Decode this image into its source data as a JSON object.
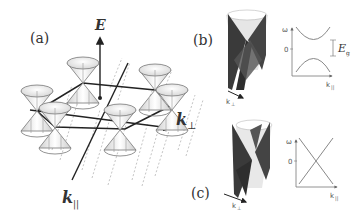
{
  "figure": {
    "panels": {
      "a": {
        "label": "(a)",
        "axis_energy": "E",
        "axis_k_perp": "k",
        "axis_k_perp_sub": "⊥",
        "axis_k_par": "k",
        "axis_k_par_sub": "||",
        "description": "Hexagonal lattice of Dirac cones in momentum space"
      },
      "b": {
        "label": "(b)",
        "cone_axis": "k",
        "cone_axis_sub": "⊥",
        "plot": {
          "y_label": "ω",
          "y_tick": "0",
          "x_label": "k",
          "x_label_sub": "||",
          "gap_label": "E",
          "gap_label_sub": "g",
          "description": "Gapped dispersion"
        }
      },
      "c": {
        "label": "(c)",
        "cone_axis": "k",
        "cone_axis_sub": "⊥",
        "plot": {
          "y_label": "ω",
          "y_tick": "0",
          "x_label": "k",
          "x_label_sub": "||",
          "description": "Linear crossing (gapless) dispersion"
        }
      }
    },
    "colors": {
      "line": "#222222",
      "cone_fill": "#f2f2f2",
      "cone_edge": "#777777",
      "dashed": "#999999",
      "plane_dark": "#3a3a3a",
      "plot_curve": "#888888"
    }
  }
}
